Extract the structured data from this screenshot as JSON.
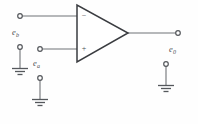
{
  "diagram": {
    "type": "circuit-schematic",
    "background_color": "#fefefe",
    "wire_color": "#6f7276",
    "symbol_color": "#3a3c40",
    "labels": {
      "input_b": {
        "base": "e",
        "sub": "b",
        "full": "e_b"
      },
      "input_a": {
        "base": "e",
        "sub": "a",
        "full": "e_a"
      },
      "output": {
        "base": "e",
        "sub": "0",
        "full": "e_0"
      }
    },
    "amplifier": {
      "name": "op-amp",
      "inverting_sign": "−",
      "noninverting_sign": "+",
      "shape": "triangle",
      "apex_x": 128,
      "left_edge_x": 77,
      "top_y": 5,
      "bottom_y": 62
    },
    "terminals": [
      {
        "name": "inverting-input-terminal",
        "x": 20,
        "y": 16
      },
      {
        "name": "input-b-ground-terminal",
        "x": 20,
        "y": 47
      },
      {
        "name": "noninverting-input-terminal",
        "x": 40,
        "y": 49
      },
      {
        "name": "input-a-ground-terminal",
        "x": 40,
        "y": 78
      },
      {
        "name": "output-terminal",
        "x": 178,
        "y": 33
      },
      {
        "name": "output-ground-terminal",
        "x": 166,
        "y": 64
      }
    ],
    "grounds": [
      {
        "name": "ground-left",
        "x": 20,
        "y": 68
      },
      {
        "name": "ground-center",
        "x": 40,
        "y": 99
      },
      {
        "name": "ground-right",
        "x": 166,
        "y": 85
      }
    ]
  }
}
